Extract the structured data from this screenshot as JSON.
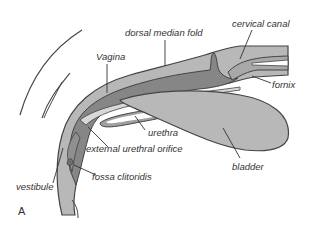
{
  "figure": {
    "panel_letter": "A",
    "colors": {
      "outline": "#444444",
      "light_tissue": "#b8b8b8",
      "mid_tissue": "#a4a4a4",
      "dark_tissue": "#808080",
      "lumen": "#ffffff",
      "label_text": "#333333"
    },
    "labels": {
      "dorsal_median_fold": "dorsal median fold",
      "cervical_canal": "cervical canal",
      "vagina": "Vagina",
      "fornix": "fornix",
      "urethra": "urethra",
      "external_urethral_orifice": "external urethral orifice",
      "bladder": "bladder",
      "vestibule": "vestibule",
      "fossa_clitoridis": "fossa clitoridis"
    }
  }
}
